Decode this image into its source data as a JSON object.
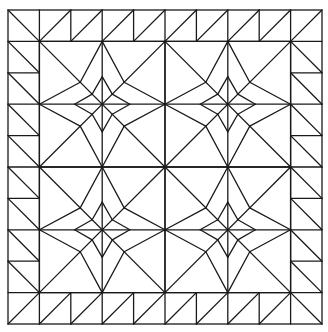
{
  "title": "Quilt block pattern — four-pointed star blocks with flying-geese border",
  "colors": {
    "line": "#1a1a1a",
    "background": "#ffffff"
  },
  "grid": {
    "cells": 10,
    "origin_x": 8,
    "origin_y": 10,
    "cell": 31.4
  },
  "border": {
    "top": {
      "cells": [
        0,
        1,
        2,
        3,
        4,
        5,
        6,
        7,
        8,
        9
      ],
      "diagonals": [
        "\\",
        "/",
        "/",
        "/",
        "/",
        "/",
        "/",
        "/",
        "/",
        "/"
      ]
    },
    "bottom": {
      "cells": [
        0,
        1,
        2,
        3,
        4,
        5,
        6,
        7,
        8,
        9
      ],
      "diagonals": [
        "/",
        "/",
        "/",
        "/",
        "/",
        "/",
        "/",
        "/",
        "/",
        "\\"
      ]
    },
    "left": {
      "rows": [
        1,
        2,
        3,
        4,
        5,
        6,
        7,
        8
      ],
      "diagonal": "\\"
    },
    "right": {
      "rows": [
        1,
        2,
        3,
        4,
        5,
        6,
        7,
        8
      ],
      "diagonal": "\\"
    }
  },
  "blocks": [
    {
      "name": "star-block-top-left",
      "center_cell": [
        3,
        3
      ]
    },
    {
      "name": "star-block-top-right",
      "center_cell": [
        7,
        3
      ]
    },
    {
      "name": "star-block-bottom-left",
      "center_cell": [
        3,
        7
      ]
    },
    {
      "name": "star-block-bottom-right",
      "center_cell": [
        7,
        7
      ]
    }
  ],
  "star": {
    "half_cells": 2,
    "outer_point_ratio": 0.35,
    "inner_tip_ratio": 0.44,
    "inner_notch_ratio": 0.16
  }
}
